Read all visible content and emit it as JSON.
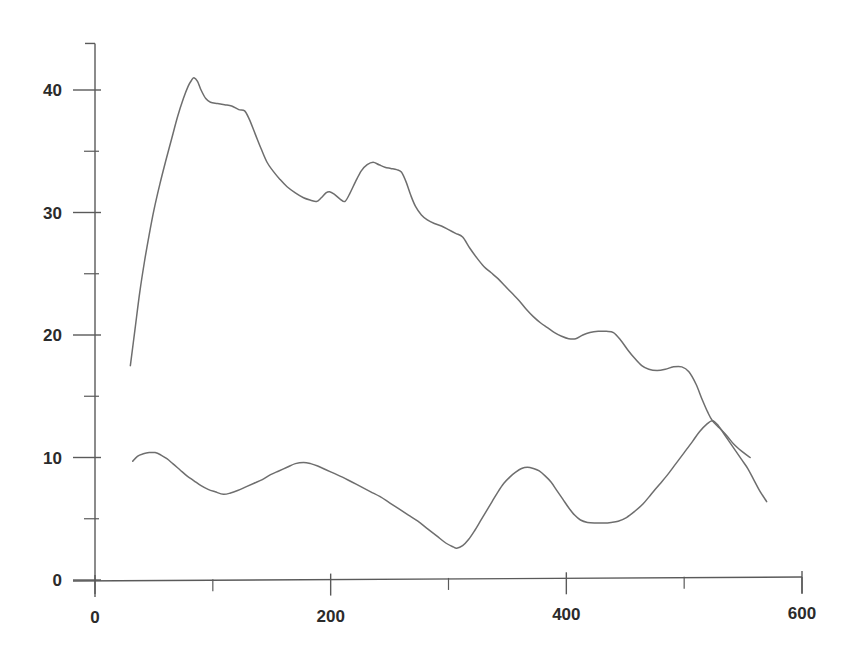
{
  "chart_data": {
    "type": "line",
    "title": "",
    "subtitle": "",
    "xlabel": "",
    "ylabel": "",
    "xlim": [
      0,
      620
    ],
    "ylim": [
      0,
      44
    ],
    "grid": false,
    "legend": "none",
    "background": "#ffffff",
    "line_color": "#6e6e6e",
    "axis_color": "#5a5a5a",
    "x_ticks_major": [
      0,
      200,
      400,
      600
    ],
    "x_tick_labels": [
      "0",
      "200",
      "400",
      "600"
    ],
    "x_ticks_minor": [
      100,
      300,
      500
    ],
    "y_ticks_major": [
      0,
      10,
      20,
      30,
      40
    ],
    "y_tick_labels": [
      "0",
      "10",
      "20",
      "30",
      "40"
    ],
    "y_ticks_minor": [
      5,
      15,
      25,
      35
    ],
    "series": [
      {
        "name": "upper-curve",
        "points": [
          [
            30,
            17.5
          ],
          [
            34,
            20.5
          ],
          [
            38,
            23.5
          ],
          [
            42,
            26.0
          ],
          [
            46,
            28.2
          ],
          [
            50,
            30.2
          ],
          [
            55,
            32.3
          ],
          [
            60,
            34.2
          ],
          [
            65,
            36.0
          ],
          [
            70,
            37.8
          ],
          [
            75,
            39.3
          ],
          [
            79,
            40.3
          ],
          [
            82,
            40.8
          ],
          [
            84,
            41.0
          ],
          [
            87,
            40.7
          ],
          [
            90,
            40.0
          ],
          [
            94,
            39.3
          ],
          [
            98,
            39.0
          ],
          [
            104,
            38.9
          ],
          [
            110,
            38.8
          ],
          [
            116,
            38.7
          ],
          [
            122,
            38.4
          ],
          [
            127,
            38.3
          ],
          [
            131,
            37.6
          ],
          [
            136,
            36.4
          ],
          [
            141,
            35.2
          ],
          [
            146,
            34.1
          ],
          [
            151,
            33.4
          ],
          [
            157,
            32.7
          ],
          [
            163,
            32.1
          ],
          [
            170,
            31.6
          ],
          [
            177,
            31.2
          ],
          [
            183,
            31.0
          ],
          [
            188,
            30.9
          ],
          [
            192,
            31.2
          ],
          [
            196,
            31.6
          ],
          [
            199,
            31.7
          ],
          [
            203,
            31.5
          ],
          [
            208,
            31.1
          ],
          [
            212,
            30.9
          ],
          [
            216,
            31.5
          ],
          [
            221,
            32.5
          ],
          [
            226,
            33.4
          ],
          [
            231,
            33.9
          ],
          [
            236,
            34.1
          ],
          [
            241,
            33.9
          ],
          [
            246,
            33.7
          ],
          [
            251,
            33.6
          ],
          [
            256,
            33.5
          ],
          [
            260,
            33.3
          ],
          [
            264,
            32.5
          ],
          [
            268,
            31.4
          ],
          [
            272,
            30.5
          ],
          [
            277,
            29.8
          ],
          [
            282,
            29.4
          ],
          [
            288,
            29.1
          ],
          [
            294,
            28.9
          ],
          [
            300,
            28.6
          ],
          [
            306,
            28.3
          ],
          [
            312,
            28.0
          ],
          [
            318,
            27.1
          ],
          [
            324,
            26.3
          ],
          [
            330,
            25.6
          ],
          [
            336,
            25.1
          ],
          [
            342,
            24.6
          ],
          [
            348,
            24.0
          ],
          [
            354,
            23.4
          ],
          [
            360,
            22.8
          ],
          [
            366,
            22.1
          ],
          [
            372,
            21.5
          ],
          [
            378,
            21.0
          ],
          [
            384,
            20.6
          ],
          [
            390,
            20.2
          ],
          [
            396,
            19.9
          ],
          [
            402,
            19.7
          ],
          [
            408,
            19.7
          ],
          [
            414,
            20.0
          ],
          [
            420,
            20.2
          ],
          [
            427,
            20.3
          ],
          [
            434,
            20.3
          ],
          [
            440,
            20.2
          ],
          [
            446,
            19.6
          ],
          [
            452,
            18.8
          ],
          [
            458,
            18.1
          ],
          [
            464,
            17.5
          ],
          [
            470,
            17.2
          ],
          [
            477,
            17.1
          ],
          [
            484,
            17.2
          ],
          [
            491,
            17.4
          ],
          [
            498,
            17.4
          ],
          [
            504,
            17.0
          ],
          [
            510,
            16.0
          ],
          [
            515,
            14.8
          ],
          [
            520,
            13.7
          ],
          [
            524,
            13.0
          ],
          [
            530,
            12.4
          ],
          [
            536,
            11.8
          ],
          [
            542,
            11.1
          ],
          [
            549,
            10.5
          ],
          [
            556,
            10.0
          ]
        ]
      },
      {
        "name": "lower-curve",
        "points": [
          [
            32,
            9.7
          ],
          [
            36,
            10.1
          ],
          [
            41,
            10.3
          ],
          [
            46,
            10.4
          ],
          [
            51,
            10.4
          ],
          [
            56,
            10.2
          ],
          [
            61,
            9.9
          ],
          [
            66,
            9.5
          ],
          [
            72,
            9.0
          ],
          [
            78,
            8.5
          ],
          [
            84,
            8.1
          ],
          [
            90,
            7.7
          ],
          [
            96,
            7.4
          ],
          [
            102,
            7.2
          ],
          [
            109,
            7.0
          ],
          [
            115,
            7.1
          ],
          [
            121,
            7.3
          ],
          [
            128,
            7.6
          ],
          [
            135,
            7.9
          ],
          [
            142,
            8.2
          ],
          [
            149,
            8.6
          ],
          [
            156,
            8.9
          ],
          [
            163,
            9.2
          ],
          [
            170,
            9.5
          ],
          [
            177,
            9.6
          ],
          [
            183,
            9.5
          ],
          [
            189,
            9.3
          ],
          [
            196,
            9.0
          ],
          [
            203,
            8.7
          ],
          [
            210,
            8.4
          ],
          [
            218,
            8.0
          ],
          [
            226,
            7.6
          ],
          [
            234,
            7.2
          ],
          [
            242,
            6.8
          ],
          [
            250,
            6.3
          ],
          [
            258,
            5.8
          ],
          [
            266,
            5.3
          ],
          [
            274,
            4.8
          ],
          [
            282,
            4.2
          ],
          [
            290,
            3.6
          ],
          [
            298,
            3.0
          ],
          [
            304,
            2.7
          ],
          [
            307,
            2.6
          ],
          [
            312,
            2.8
          ],
          [
            317,
            3.3
          ],
          [
            322,
            4.0
          ],
          [
            327,
            4.8
          ],
          [
            332,
            5.6
          ],
          [
            337,
            6.4
          ],
          [
            342,
            7.2
          ],
          [
            347,
            7.9
          ],
          [
            352,
            8.4
          ],
          [
            357,
            8.8
          ],
          [
            362,
            9.1
          ],
          [
            367,
            9.2
          ],
          [
            372,
            9.1
          ],
          [
            377,
            8.9
          ],
          [
            382,
            8.5
          ],
          [
            387,
            8.0
          ],
          [
            392,
            7.3
          ],
          [
            397,
            6.6
          ],
          [
            402,
            5.9
          ],
          [
            407,
            5.3
          ],
          [
            412,
            4.9
          ],
          [
            418,
            4.7
          ],
          [
            425,
            4.65
          ],
          [
            432,
            4.65
          ],
          [
            438,
            4.7
          ],
          [
            444,
            4.8
          ],
          [
            451,
            5.1
          ],
          [
            458,
            5.6
          ],
          [
            465,
            6.2
          ],
          [
            472,
            7.0
          ],
          [
            479,
            7.8
          ],
          [
            486,
            8.6
          ],
          [
            493,
            9.5
          ],
          [
            500,
            10.4
          ],
          [
            507,
            11.3
          ],
          [
            513,
            12.1
          ],
          [
            519,
            12.7
          ],
          [
            524,
            13.0
          ],
          [
            529,
            12.6
          ],
          [
            534,
            11.9
          ],
          [
            539,
            11.2
          ],
          [
            544,
            10.5
          ],
          [
            549,
            9.8
          ],
          [
            554,
            9.1
          ],
          [
            559,
            8.2
          ],
          [
            564,
            7.3
          ],
          [
            570,
            6.4
          ]
        ]
      }
    ]
  }
}
